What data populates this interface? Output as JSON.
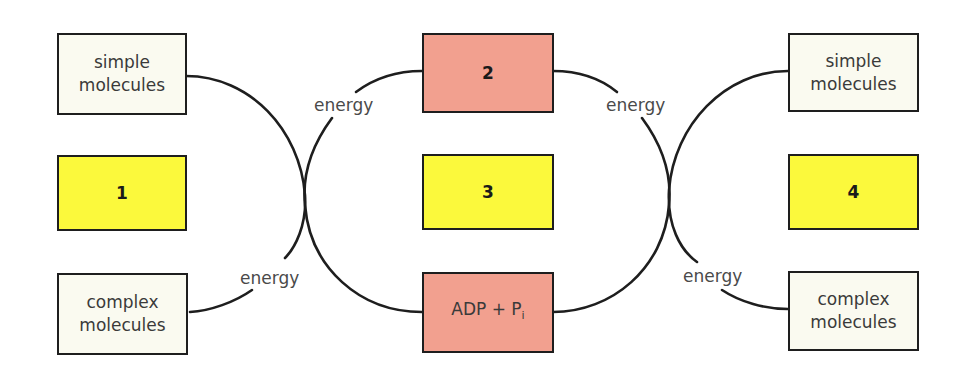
{
  "diagram": {
    "colors": {
      "molecule_box": "#fafaf0",
      "numbered_box_yellow": "#fbf93c",
      "atp_box_pink": "#f2a08f",
      "line": "#1e1e1e"
    },
    "left": {
      "top": {
        "line1": "simple",
        "line2": "molecules"
      },
      "middle": {
        "number": "1"
      },
      "bottom": {
        "line1": "complex",
        "line2": "molecules"
      }
    },
    "center": {
      "top": {
        "number": "2"
      },
      "middle": {
        "number": "3"
      },
      "bottom": {
        "main": "ADP + P",
        "subscript": "i"
      }
    },
    "right": {
      "top": {
        "line1": "simple",
        "line2": "molecules"
      },
      "middle": {
        "number": "4"
      },
      "bottom": {
        "line1": "complex",
        "line2": "molecules"
      }
    },
    "energy_labels": [
      "energy",
      "energy",
      "energy",
      "energy"
    ]
  }
}
